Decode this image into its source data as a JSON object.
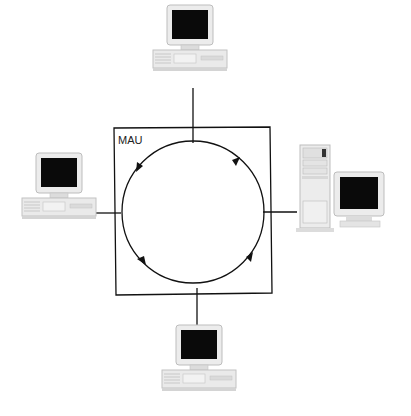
{
  "diagram": {
    "type": "token-ring-mau",
    "mau_label": "MAU",
    "ring_direction": "counter-clockwise",
    "nodes": [
      {
        "id": "top",
        "kind": "desktop-computer",
        "position": "top"
      },
      {
        "id": "left",
        "kind": "desktop-computer",
        "position": "left"
      },
      {
        "id": "right",
        "kind": "tower-server",
        "position": "right"
      },
      {
        "id": "bottom",
        "kind": "desktop-computer",
        "position": "bottom"
      }
    ],
    "colors": {
      "line": "#111111",
      "screen": "#0a0a0a",
      "case": "#e8e8e8",
      "case_shade": "#cfcfcf"
    }
  }
}
